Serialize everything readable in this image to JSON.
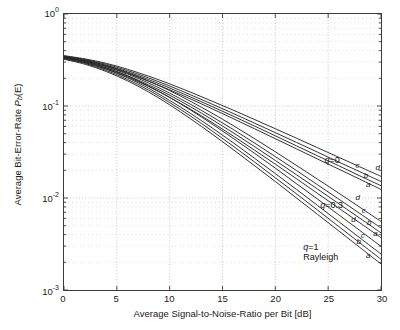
{
  "chart_data": {
    "type": "line",
    "title": "",
    "xlabel": "Average Signal-to-Noise-Ratio per Bit [dB]",
    "ylabel": "Average Bit-Error-Rate P_b(E)",
    "ylabel_parts": {
      "pre": "Average Bit-Error-Rate ",
      "sym": "P",
      "sub": "b",
      "post": "(E)"
    },
    "xlim": [
      0,
      30
    ],
    "ylim": [
      0.001,
      1
    ],
    "yscale": "log",
    "xscale": "linear",
    "grid": "on, dotted, major and log-minor",
    "legend": "none (in-plot text annotations)",
    "xticks": [
      "0",
      "5",
      "10",
      "15",
      "20",
      "25",
      "30"
    ],
    "xtick_values": [
      0,
      5,
      10,
      15,
      20,
      25,
      30
    ],
    "yticks": [
      "10^0",
      "10^-1",
      "10^-2",
      "10^-3"
    ],
    "ytick_mantissa": [
      "10",
      "10",
      "10",
      "10"
    ],
    "ytick_exponent": [
      "0",
      "-1",
      "-2",
      "-3"
    ],
    "ytick_values": [
      1,
      0.1,
      0.01,
      0.001
    ],
    "x": [
      0,
      2,
      4,
      6,
      8,
      10,
      12,
      14,
      16,
      18,
      20,
      22,
      24,
      26,
      28,
      30
    ],
    "groups": [
      {
        "name": "q=0",
        "label": "q=0",
        "label_q": "q",
        "label_eq": "=0",
        "series": [
          {
            "name": "a",
            "values": [
              0.34,
              0.309,
              0.27,
              0.227,
              0.186,
              0.15,
              0.119,
              0.0935,
              0.073,
              0.0568,
              0.0441,
              0.0342,
              0.0265,
              0.0206,
              0.016,
              0.0124
            ]
          },
          {
            "name": "b",
            "values": [
              0.345,
              0.315,
              0.277,
              0.235,
              0.194,
              0.157,
              0.125,
              0.0989,
              0.0777,
              0.0608,
              0.0474,
              0.0369,
              0.0287,
              0.0224,
              0.0174,
              0.0136
            ]
          },
          {
            "name": "c",
            "values": [
              0.349,
              0.32,
              0.284,
              0.243,
              0.202,
              0.165,
              0.132,
              0.105,
              0.0831,
              0.0654,
              0.0513,
              0.0402,
              0.0315,
              0.0246,
              0.0193,
              0.0151
            ]
          },
          {
            "name": "d",
            "values": [
              0.353,
              0.325,
              0.291,
              0.251,
              0.211,
              0.174,
              0.141,
              0.113,
              0.0903,
              0.0716,
              0.0566,
              0.0447,
              0.0352,
              0.0277,
              0.0218,
              0.0172
            ]
          }
        ]
      },
      {
        "name": "q=0.3",
        "label": "q=0.3",
        "label_q": "q",
        "label_eq": "=0.3",
        "series": [
          {
            "name": "a",
            "values": [
              0.33,
              0.296,
              0.253,
              0.207,
              0.163,
              0.124,
              0.0917,
              0.0664,
              0.0473,
              0.0333,
              0.0233,
              0.0162,
              0.0112,
              0.00776,
              0.00537,
              0.00371
            ]
          },
          {
            "name": "b",
            "values": [
              0.335,
              0.302,
              0.26,
              0.214,
              0.17,
              0.131,
              0.0977,
              0.0714,
              0.0513,
              0.0364,
              0.0256,
              0.0179,
              0.0125,
              0.00868,
              0.00603,
              0.00418
            ]
          },
          {
            "name": "c",
            "values": [
              0.34,
              0.308,
              0.267,
              0.222,
              0.178,
              0.138,
              0.104,
              0.0768,
              0.0557,
              0.0398,
              0.0282,
              0.0199,
              0.0139,
              0.00973,
              0.00678,
              0.00472
            ]
          },
          {
            "name": "d",
            "values": [
              0.345,
              0.314,
              0.275,
              0.231,
              0.187,
              0.147,
              0.112,
              0.0837,
              0.0614,
              0.0444,
              0.0318,
              0.0226,
              0.016,
              0.0113,
              0.00793,
              0.00556
            ]
          }
        ]
      },
      {
        "name": "q=1 Rayleigh",
        "label": "q=1 Rayleigh",
        "label_q": "q",
        "label_eq": "=1",
        "label_line2": "Rayleigh",
        "series": [
          {
            "name": "a",
            "values": [
              0.322,
              0.284,
              0.237,
              0.188,
              0.142,
              0.103,
              0.0723,
              0.0497,
              0.0337,
              0.0226,
              0.0151,
              0.01,
              0.00663,
              0.00439,
              0.0029,
              0.00192
            ]
          },
          {
            "name": "b",
            "values": [
              0.327,
              0.29,
              0.244,
              0.195,
              0.149,
              0.109,
              0.0774,
              0.0537,
              0.0367,
              0.0248,
              0.0166,
              0.0111,
              0.00738,
              0.0049,
              0.00325,
              0.00216
            ]
          },
          {
            "name": "c",
            "values": [
              0.332,
              0.296,
              0.251,
              0.203,
              0.156,
              0.115,
              0.0827,
              0.058,
              0.04,
              0.0272,
              0.0184,
              0.0124,
              0.00829,
              0.00554,
              0.00369,
              0.00246
            ]
          },
          {
            "name": "d",
            "values": [
              0.337,
              0.303,
              0.259,
              0.212,
              0.165,
              0.124,
              0.09,
              0.0639,
              0.0446,
              0.0308,
              0.0211,
              0.0143,
              0.00972,
              0.00657,
              0.00443,
              0.00298
            ]
          }
        ]
      }
    ],
    "annotations": [
      {
        "id": "q0",
        "text": "q=0",
        "x": 24.6,
        "y": 0.0295
      },
      {
        "id": "q03",
        "text": "q=0.3",
        "x": 24.2,
        "y": 0.00955
      },
      {
        "id": "q1",
        "text": "q=1",
        "x": 22.6,
        "y": 0.00335
      },
      {
        "id": "rayleigh",
        "text": "Rayleigh",
        "x": 21.7,
        "y": 0.00272
      }
    ],
    "curve_letters": [
      "a",
      "b",
      "c",
      "d"
    ]
  },
  "colors": {
    "axis": "#3a3a3a",
    "grid": "#b9b9b9",
    "curve": "#262626",
    "background": "#ffffff",
    "text": "#1a1a1a"
  }
}
